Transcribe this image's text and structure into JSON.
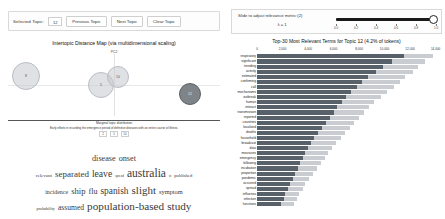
{
  "toolbar": {
    "selected_topic_label": "Selected Topic:",
    "selected_topic_value": "12",
    "previous_label": "Previous Topic",
    "next_label": "Next Topic",
    "clear_label": "Clear Topic"
  },
  "slider": {
    "label": "Slide to adjust relevance metric:(2)",
    "lambda_text": "λ = 1",
    "value": 1.0,
    "ticks": [
      "0.0",
      "0.2",
      "0.4",
      "0.6",
      "0.8",
      "1.0"
    ]
  },
  "map": {
    "title": "Intertopic Distance Map (via multidimensional scaling)",
    "axis_y_label": "PC2",
    "axis_x_label": "PC1",
    "legend_title": "Marginal topic distribution",
    "legend_caption": "Early efforts in recording the emergence period of definitive diseases with an entire course of illness.",
    "legend_sizes": [
      "2",
      "5",
      "10"
    ],
    "selected_topic": 12,
    "bubbles": [
      {
        "id": "8",
        "cx": 18,
        "cy": 22,
        "r": 14,
        "selected": false
      },
      {
        "id": "5",
        "cx": 93,
        "cy": 31,
        "r": 13,
        "selected": false
      },
      {
        "id": "10",
        "cx": 110,
        "cy": 23,
        "r": 11,
        "selected": false
      },
      {
        "id": "12",
        "cx": 182,
        "cy": 40,
        "r": 11,
        "selected": true
      }
    ]
  },
  "wordcloud": {
    "rows": [
      [
        {
          "t": "disease",
          "s": 8.2
        },
        {
          "t": "onset",
          "s": 8.2
        }
      ],
      [
        {
          "t": "relevant",
          "s": 5.0
        },
        {
          "t": "separated",
          "s": 9.0
        },
        {
          "t": "leave",
          "s": 9.6
        },
        {
          "t": "spread",
          "s": 3.4
        },
        {
          "t": "australia",
          "s": 11.5
        },
        {
          "t": "in",
          "s": 3.0
        },
        {
          "t": "published",
          "s": 4.6
        }
      ],
      [
        {
          "t": "incidence",
          "s": 6.0
        },
        {
          "t": "ship",
          "s": 8.6
        },
        {
          "t": "flu",
          "s": 8.0
        },
        {
          "t": "spanish",
          "s": 9.4
        },
        {
          "t": "slight",
          "s": 11.0
        },
        {
          "t": "symptom",
          "s": 6.4
        }
      ],
      [
        {
          "t": "probability",
          "s": 4.2
        },
        {
          "t": "assumed",
          "s": 7.6
        },
        {
          "t": "population-based",
          "s": 11.2
        },
        {
          "t": "study",
          "s": 11.2
        }
      ],
      [
        {
          "t": "methods",
          "s": 3.4
        },
        {
          "t": "prevention",
          "s": 5.4
        },
        {
          "t": "employed",
          "s": 5.0
        }
      ]
    ]
  },
  "chart_data": {
    "type": "bar",
    "title": "Top-30 Most Relevant Terms for Topic 12 (4.2% of tokens)",
    "xlabel": "",
    "ylabel": "",
    "xlim": [
      0,
      14500
    ],
    "xticks": [
      0,
      2000,
      4000,
      6000,
      8000,
      10000,
      12000,
      14000
    ],
    "xticklabels": [
      "0",
      "2,000",
      "4,000",
      "6,000",
      "8,000",
      "10,000",
      "12,000",
      "14,000"
    ],
    "grid": true,
    "legend": [
      "Overall term frequency",
      "Estimated term frequency within the selected topic"
    ],
    "categories": [
      "respiratory",
      "significant",
      "trending",
      "activity",
      "estimated",
      "confirming",
      "call",
      "mechanisms",
      "outbreak",
      "human",
      "interact",
      "transmission",
      "reported",
      "countries",
      "localized",
      "deaths",
      "household",
      "broadcast",
      "data",
      "measures",
      "emergency",
      "following",
      "incubation",
      "proportion",
      "pandemic",
      "occurred",
      "spread",
      "influenza",
      "infection",
      "functions"
    ],
    "series": [
      {
        "name": "Overall term frequency",
        "values": [
          13800,
          13200,
          12600,
          12200,
          11600,
          11200,
          10700,
          10200,
          9700,
          9200,
          8800,
          8400,
          8000,
          7600,
          7300,
          6900,
          6600,
          6200,
          5900,
          5600,
          5300,
          5000,
          4700,
          4400,
          4100,
          3800,
          3600,
          3300,
          3100,
          2900
        ]
      },
      {
        "name": "Estimated term frequency within the selected topic",
        "values": [
          11500,
          10600,
          9900,
          9300,
          8700,
          8200,
          7800,
          7400,
          7000,
          6700,
          6300,
          6000,
          5700,
          5400,
          5100,
          4800,
          4500,
          4200,
          4000,
          3800,
          3600,
          3400,
          3200,
          3000,
          2800,
          2600,
          2400,
          2200,
          2100,
          1900
        ]
      }
    ]
  }
}
